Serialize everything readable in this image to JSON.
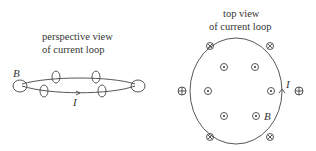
{
  "left_panel": {
    "title_line1": "perspective view",
    "title_line2": "of current loop",
    "current_label": "I",
    "field_label": "B"
  },
  "right_panel": {
    "title_line1": "top view",
    "title_line2": "of current loop",
    "current_label": "I",
    "field_label": "B",
    "symbols": {
      "out_of_page": "dot-in-circle (field out of page, inside loop)",
      "into_page": "cross-in-circle (field into page, outside loop)"
    }
  }
}
